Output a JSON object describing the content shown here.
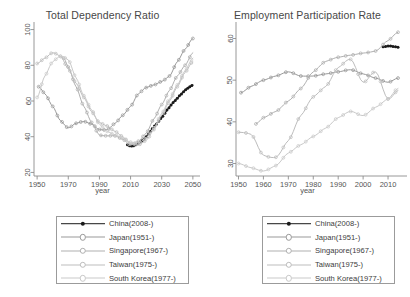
{
  "figure": {
    "width": 410,
    "height": 297,
    "background": "#ffffff"
  },
  "series_styles": [
    {
      "key": "china",
      "color": "#1a1a1a",
      "marker": "filled-circle"
    },
    {
      "key": "japan",
      "color": "#9a9a9a",
      "marker": "open-circle"
    },
    {
      "key": "singapore",
      "color": "#b0b0b0",
      "marker": "open-circle"
    },
    {
      "key": "taiwan",
      "color": "#bdbdbd",
      "marker": "open-circle"
    },
    {
      "key": "korea",
      "color": "#c9c9c9",
      "marker": "open-circle"
    }
  ],
  "legend": {
    "items": [
      {
        "label": "China(2008-)",
        "color": "#1a1a1a"
      },
      {
        "label": "Japan(1951-)",
        "color": "#9a9a9a"
      },
      {
        "label": "Singapore(1967-)",
        "color": "#b0b0b0"
      },
      {
        "label": "Taiwan(1975-)",
        "color": "#bdbdbd"
      },
      {
        "label": "South Korea(1977-)",
        "color": "#c9c9c9"
      }
    ]
  },
  "chart_data": [
    {
      "type": "line",
      "panel": "left",
      "title": "Total Dependency Ratio",
      "xlabel": "year",
      "ylabel": "",
      "xlim": [
        1948,
        2052
      ],
      "ylim": [
        18,
        102
      ],
      "xticks": [
        1950,
        1970,
        1990,
        2010,
        2030,
        2050
      ],
      "yticks": [
        20,
        40,
        60,
        80,
        100
      ],
      "grid": false,
      "legend_position": "below",
      "series": [
        {
          "name": "China(2008-)",
          "x": [
            2008,
            2010,
            2012,
            2014,
            2016,
            2018,
            2020,
            2022,
            2024,
            2026,
            2028,
            2030,
            2032,
            2034,
            2036,
            2038,
            2040,
            2042,
            2044,
            2046,
            2048,
            2050
          ],
          "values": [
            35.5,
            34.8,
            35.0,
            35.8,
            36.8,
            38.2,
            40.0,
            42.2,
            44.6,
            46.6,
            48.6,
            50.8,
            53.2,
            55.6,
            57.8,
            59.8,
            61.6,
            63.4,
            65.2,
            66.8,
            68.0,
            69.0
          ]
        },
        {
          "name": "Japan(1951-)",
          "x": [
            1951,
            1955,
            1960,
            1965,
            1970,
            1975,
            1980,
            1985,
            1990,
            1995,
            2000,
            2005,
            2010,
            2015,
            2020,
            2025,
            2030,
            2035,
            2040,
            2045,
            2050
          ],
          "values": [
            68.0,
            64.0,
            57.0,
            49.0,
            45.0,
            47.5,
            48.5,
            47.0,
            44.0,
            44.0,
            47.5,
            52.0,
            57.0,
            64.0,
            67.5,
            69.0,
            71.0,
            74.0,
            82.0,
            89.0,
            95.0
          ]
        },
        {
          "name": "Singapore(1967-)",
          "x": [
            1967,
            1970,
            1975,
            1980,
            1985,
            1990,
            1995,
            2000,
            2005,
            2010,
            2015,
            2020,
            2025,
            2030,
            2035,
            2040,
            2045,
            2050
          ],
          "values": [
            84.0,
            79.0,
            68.0,
            57.0,
            48.0,
            41.0,
            40.5,
            40.5,
            38.5,
            35.5,
            37.5,
            42.0,
            50.0,
            58.0,
            66.0,
            74.0,
            80.0,
            87.0
          ]
        },
        {
          "name": "Taiwan(1975-)",
          "x": [
            1950,
            1955,
            1960,
            1965,
            1970,
            1975,
            1980,
            1985,
            1990,
            1995,
            2000,
            2005,
            2010,
            2015,
            2020,
            2025,
            2030,
            2035,
            2040,
            2045,
            2050
          ],
          "values": [
            81.0,
            84.0,
            87.0,
            85.0,
            78.0,
            70.0,
            62.0,
            54.0,
            48.0,
            46.0,
            43.0,
            40.0,
            36.0,
            35.5,
            38.0,
            44.0,
            52.0,
            60.0,
            68.0,
            76.0,
            82.0
          ]
        },
        {
          "name": "South Korea(1977-)",
          "x": [
            1950,
            1955,
            1960,
            1965,
            1970,
            1975,
            1980,
            1985,
            1990,
            1995,
            2000,
            2005,
            2010,
            2015,
            2020,
            2025,
            2030,
            2035,
            2040,
            2045,
            2050
          ],
          "values": [
            62.0,
            74.0,
            82.0,
            85.0,
            83.0,
            73.0,
            63.0,
            55.0,
            47.0,
            43.0,
            41.0,
            39.0,
            37.0,
            36.5,
            39.5,
            45.0,
            53.0,
            61.0,
            69.0,
            77.0,
            84.0
          ]
        }
      ]
    },
    {
      "type": "line",
      "panel": "right",
      "title": "Employment Participation Rate",
      "xlabel": "year",
      "ylabel": "",
      "xlim": [
        1949,
        2016
      ],
      "ylim": [
        27,
        63
      ],
      "xticks": [
        1950,
        1960,
        1970,
        1980,
        1990,
        2000,
        2010
      ],
      "yticks": [
        30,
        40,
        50,
        60
      ],
      "grid": false,
      "legend_position": "below",
      "series": [
        {
          "name": "China(2008-)",
          "x": [
            2008,
            2009,
            2010,
            2011,
            2012,
            2013,
            2014
          ],
          "values": [
            58.0,
            58.1,
            58.2,
            58.2,
            58.1,
            58.0,
            57.9
          ]
        },
        {
          "name": "Japan(1951-)",
          "x": [
            1951,
            1955,
            1960,
            1965,
            1970,
            1975,
            1980,
            1985,
            1990,
            1995,
            2000,
            2005,
            2010,
            2014
          ],
          "values": [
            47.0,
            48.5,
            50.0,
            51.0,
            52.0,
            51.0,
            51.0,
            51.5,
            52.0,
            52.5,
            51.5,
            50.5,
            49.5,
            50.5
          ]
        },
        {
          "name": "Singapore(1967-)",
          "x": [
            1957,
            1960,
            1965,
            1970,
            1975,
            1980,
            1985,
            1990,
            1995,
            2000,
            2005,
            2010,
            2014
          ],
          "values": [
            39.5,
            41.0,
            42.5,
            45.0,
            48.0,
            52.0,
            54.5,
            55.5,
            56.0,
            56.5,
            57.0,
            59.5,
            61.5
          ]
        },
        {
          "name": "Taiwan(1975-)",
          "x": [
            1950,
            1955,
            1960,
            1965,
            1970,
            1975,
            1980,
            1985,
            1990,
            1995,
            2000,
            2005,
            2010,
            2014
          ],
          "values": [
            37.5,
            37.0,
            32.0,
            31.5,
            35.5,
            41.5,
            46.0,
            48.5,
            53.0,
            55.0,
            49.5,
            52.0,
            45.5,
            47.5
          ]
        },
        {
          "name": "South Korea(1977-)",
          "x": [
            1950,
            1955,
            1960,
            1965,
            1970,
            1975,
            1980,
            1985,
            1990,
            1995,
            2000,
            2005,
            2010,
            2014
          ],
          "values": [
            30.0,
            29.0,
            28.2,
            29.5,
            32.5,
            34.5,
            36.5,
            38.5,
            41.0,
            42.5,
            41.5,
            43.5,
            45.5,
            48.0
          ]
        }
      ]
    }
  ]
}
